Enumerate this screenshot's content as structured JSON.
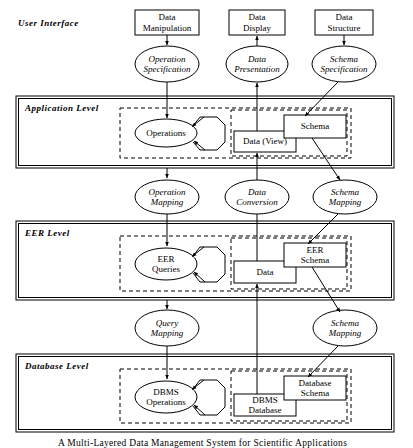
{
  "figure": {
    "caption": "A Multi-Layered Data Management System for Scientific Applications"
  },
  "layers": {
    "user_interface": "User  Interface",
    "application": "Application  Level",
    "eer": "EER  Level",
    "database": "Database  Level"
  },
  "top_boxes": [
    {
      "label": "Data\nManipulation"
    },
    {
      "label": "Data\nDisplay"
    },
    {
      "label": "Data\nStructure"
    }
  ],
  "interface_ellipses": [
    {
      "label": "Operation\nSpecification"
    },
    {
      "label": "Data\nPresentation"
    },
    {
      "label": "Schema\nSpecification"
    }
  ],
  "mapping_ellipses_upper": [
    {
      "label": "Operation\nMapping"
    },
    {
      "label": "Data\nConversion"
    },
    {
      "label": "Schema\nMapping"
    }
  ],
  "mapping_ellipses_lower": [
    {
      "label": "Query\nMapping"
    },
    {
      "label": "Schema\nMapping"
    }
  ],
  "application_level": {
    "operations": "Operations",
    "data": "Data (View)",
    "schema": "Schema"
  },
  "eer_level": {
    "operations": "EER\nQueries",
    "data": "Data",
    "schema": "EER\nSchema"
  },
  "database_level": {
    "operations": "DBMS\nOperations",
    "data": "DBMS\nDatabase",
    "schema": "Database\nSchema"
  },
  "colors": {
    "stroke": "#000000",
    "background": "#ffffff"
  }
}
